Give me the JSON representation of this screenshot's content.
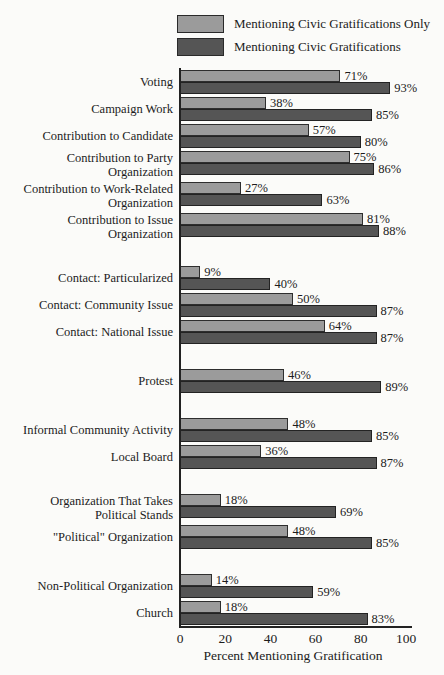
{
  "colors": {
    "bar_light": "#9b9b9b",
    "bar_dark": "#555555",
    "axis": "#222222",
    "text": "#1c1c1c",
    "background": "#fbfbf9"
  },
  "legend": {
    "entries": [
      {
        "label": "Mentioning Civic Gratifications Only",
        "color": "#9b9b9b"
      },
      {
        "label": "Mentioning Civic Gratifications",
        "color": "#555555"
      }
    ]
  },
  "chart_data": {
    "type": "bar",
    "orientation": "horizontal",
    "title": "",
    "xlabel": "Percent Mentioning Gratification",
    "ylabel": "",
    "xlim": [
      0,
      100
    ],
    "xticks": [
      "0",
      "20",
      "40",
      "60",
      "80",
      "100"
    ],
    "grid": false,
    "legend_position": "top",
    "series_names": [
      "Mentioning Civic Gratifications Only",
      "Mentioning Civic Gratifications"
    ],
    "groups": [
      {
        "rows": [
          {
            "category": "Voting",
            "values": [
              71,
              93
            ],
            "labels": [
              "71%",
              "93%"
            ]
          },
          {
            "category": "Campaign Work",
            "values": [
              38,
              85
            ],
            "labels": [
              "38%",
              "85%"
            ]
          },
          {
            "category": "Contribution to Candidate",
            "values": [
              57,
              80
            ],
            "labels": [
              "57%",
              "80%"
            ]
          },
          {
            "category": "Contribution to Party Organization",
            "values": [
              75,
              86
            ],
            "labels": [
              "75%",
              "86%"
            ]
          },
          {
            "category": "Contribution to Work-Related Organization",
            "values": [
              27,
              63
            ],
            "labels": [
              "27%",
              "63%"
            ]
          },
          {
            "category": "Contribution to Issue Organization",
            "values": [
              81,
              88
            ],
            "labels": [
              "81%",
              "88%"
            ]
          }
        ]
      },
      {
        "rows": [
          {
            "category": "Contact: Particularized",
            "values": [
              9,
              40
            ],
            "labels": [
              "9%",
              "40%"
            ]
          },
          {
            "category": "Contact: Community Issue",
            "values": [
              50,
              87
            ],
            "labels": [
              "50%",
              "87%"
            ]
          },
          {
            "category": "Contact: National Issue",
            "values": [
              64,
              87
            ],
            "labels": [
              "64%",
              "87%"
            ]
          }
        ]
      },
      {
        "rows": [
          {
            "category": "Protest",
            "values": [
              46,
              89
            ],
            "labels": [
              "46%",
              "89%"
            ]
          }
        ]
      },
      {
        "rows": [
          {
            "category": "Informal Community Activity",
            "values": [
              48,
              85
            ],
            "labels": [
              "48%",
              "85%"
            ]
          },
          {
            "category": "Local Board",
            "values": [
              36,
              87
            ],
            "labels": [
              "36%",
              "87%"
            ]
          }
        ]
      },
      {
        "rows": [
          {
            "category": "Organization That Takes Political Stands",
            "values": [
              18,
              69
            ],
            "labels": [
              "18%",
              "69%"
            ]
          },
          {
            "category": "\"Political\" Organization",
            "values": [
              48,
              85
            ],
            "labels": [
              "48%",
              "85%"
            ]
          }
        ]
      },
      {
        "rows": [
          {
            "category": "Non-Political Organization",
            "values": [
              14,
              59
            ],
            "labels": [
              "14%",
              "59%"
            ]
          },
          {
            "category": "Church",
            "values": [
              18,
              83
            ],
            "labels": [
              "18%",
              "83%"
            ]
          }
        ]
      }
    ]
  }
}
